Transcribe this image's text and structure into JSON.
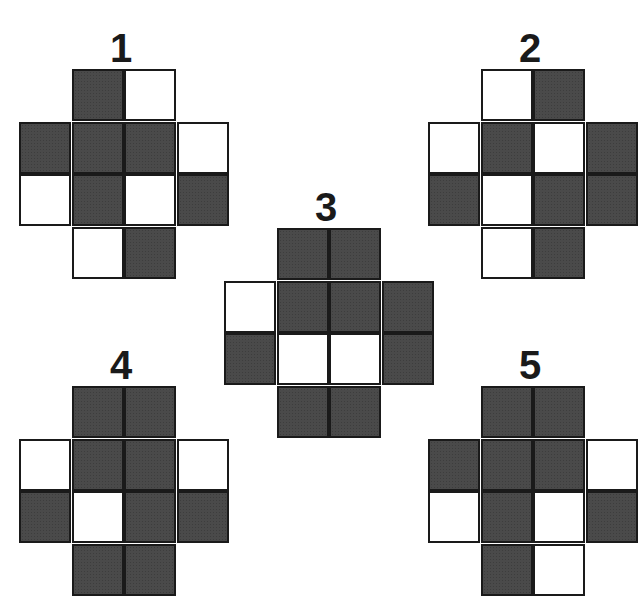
{
  "figure": {
    "colors": {
      "filled": "#4a4a4a",
      "empty": "#ffffff",
      "border": "#1a1a1a"
    },
    "cell_size": 52,
    "shape": "cross-shaped 12-cell grid (rows of 2,4,4,2)",
    "puzzles": [
      {
        "label": "1",
        "origin": [
          19,
          69
        ],
        "label_pos": [
          91,
          28
        ],
        "rows": [
          {
            "offset": 1,
            "cells": [
              1,
              0
            ]
          },
          {
            "offset": 0,
            "cells": [
              1,
              1,
              1,
              0
            ]
          },
          {
            "offset": 0,
            "cells": [
              0,
              1,
              0,
              1
            ]
          },
          {
            "offset": 1,
            "cells": [
              0,
              1
            ]
          }
        ]
      },
      {
        "label": "2",
        "origin": [
          428,
          69
        ],
        "label_pos": [
          500,
          28
        ],
        "rows": [
          {
            "offset": 1,
            "cells": [
              0,
              1
            ]
          },
          {
            "offset": 0,
            "cells": [
              0,
              1,
              0,
              1
            ]
          },
          {
            "offset": 0,
            "cells": [
              1,
              0,
              1,
              1
            ]
          },
          {
            "offset": 1,
            "cells": [
              0,
              1
            ]
          }
        ]
      },
      {
        "label": "3",
        "origin": [
          224,
          228
        ],
        "label_pos": [
          296,
          187
        ],
        "rows": [
          {
            "offset": 1,
            "cells": [
              1,
              1
            ]
          },
          {
            "offset": 0,
            "cells": [
              0,
              1,
              1,
              1
            ]
          },
          {
            "offset": 0,
            "cells": [
              1,
              0,
              0,
              1
            ]
          },
          {
            "offset": 1,
            "cells": [
              1,
              1
            ]
          }
        ]
      },
      {
        "label": "4",
        "origin": [
          19,
          386
        ],
        "label_pos": [
          91,
          345
        ],
        "rows": [
          {
            "offset": 1,
            "cells": [
              1,
              1
            ]
          },
          {
            "offset": 0,
            "cells": [
              0,
              1,
              1,
              0
            ]
          },
          {
            "offset": 0,
            "cells": [
              1,
              0,
              1,
              1
            ]
          },
          {
            "offset": 1,
            "cells": [
              1,
              1
            ]
          }
        ]
      },
      {
        "label": "5",
        "origin": [
          428,
          386
        ],
        "label_pos": [
          500,
          345
        ],
        "rows": [
          {
            "offset": 1,
            "cells": [
              1,
              1
            ]
          },
          {
            "offset": 0,
            "cells": [
              1,
              1,
              1,
              0
            ]
          },
          {
            "offset": 0,
            "cells": [
              0,
              1,
              0,
              1
            ]
          },
          {
            "offset": 1,
            "cells": [
              1,
              0
            ]
          }
        ]
      }
    ]
  }
}
